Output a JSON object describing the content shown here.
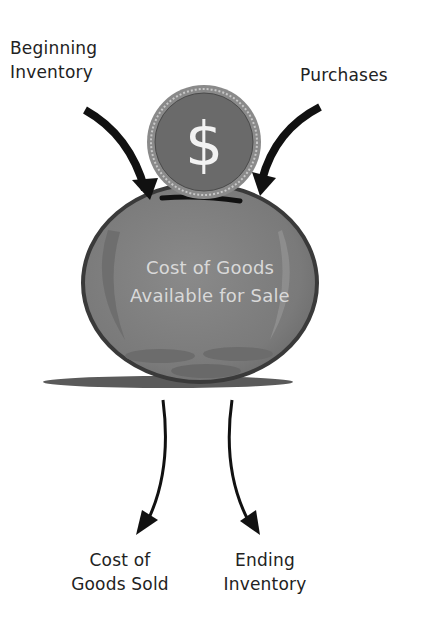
{
  "diagram": {
    "inputs": [
      {
        "label_line1": "Beginning",
        "label_line2": "Inventory"
      },
      {
        "label_line1": "Purchases"
      }
    ],
    "center": {
      "line1": "Cost of Goods",
      "line2": "Available for Sale",
      "coin_symbol": "$"
    },
    "outputs": [
      {
        "label_line1": "Cost of",
        "label_line2": "Goods Sold"
      },
      {
        "label_line1": "Ending",
        "label_line2": "Inventory"
      }
    ],
    "colors": {
      "jar_fill": "#7b7b7b",
      "jar_outline": "#3a3a3a",
      "coin_fill": "#6a6a6a",
      "coin_rim": "#8a8a8a",
      "coin_symbol": "#f2f2f2",
      "arrow": "#111111",
      "shadow": "#5a5a5a",
      "center_text": "#d9d9d9"
    }
  }
}
